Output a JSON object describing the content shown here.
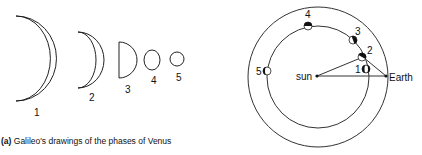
{
  "left_panel": {
    "caption_tag": "(a)",
    "caption_text": "Galileo's drawings of the phases of Venus",
    "phases": [
      {
        "label": "1"
      },
      {
        "label": "2"
      },
      {
        "label": "3"
      },
      {
        "label": "4"
      },
      {
        "label": "5"
      }
    ]
  },
  "right_panel": {
    "sun_label": "sun",
    "earth_label": "Earth",
    "positions": [
      {
        "label": "1"
      },
      {
        "label": "2"
      },
      {
        "label": "3"
      },
      {
        "label": "4"
      },
      {
        "label": "5"
      }
    ]
  }
}
